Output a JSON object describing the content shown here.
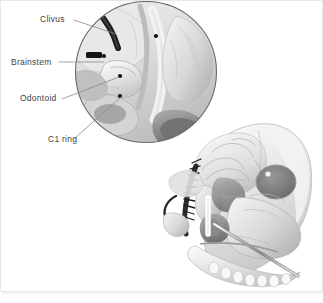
{
  "figure": {
    "style": "grayscale medical illustration",
    "background_color": "#ffffff",
    "border_color": "#e8e8e8",
    "label_color": "#3f3f3f"
  },
  "labels": [
    {
      "id": "clivus",
      "text": "Clivus"
    },
    {
      "id": "brainstem",
      "text": "Brainstem"
    },
    {
      "id": "odontoid",
      "text": "Odontoid"
    },
    {
      "id": "c1ring",
      "text": "C1 ring"
    }
  ],
  "inset": {
    "name": "magnified-craniovertebral-junction",
    "shape": "circle",
    "center_x": 146,
    "center_y": 72,
    "radius": 71,
    "outline_color": "#6a6a6a"
  },
  "main_illustration": {
    "name": "sagittal-skull-cutaway",
    "description": "Lateral sagittal cutaway of skull showing brain, nasal cavity, sinuses, mandible and a surgical instrument entering through the nasal corridor"
  },
  "instrument": {
    "name": "endoscopic-surgical-probe",
    "color": "#9a9a9a"
  }
}
